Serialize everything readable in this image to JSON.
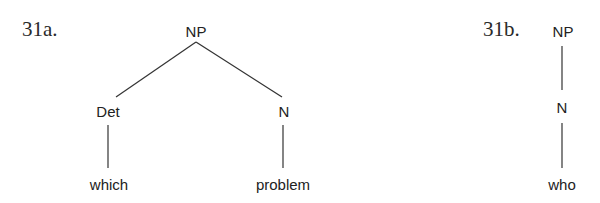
{
  "diagrams": {
    "a": {
      "label": "31a.",
      "root": "NP",
      "left_category": "Det",
      "right_category": "N",
      "left_word": "which",
      "right_word": "problem"
    },
    "b": {
      "label": "31b.",
      "root": "NP",
      "category": "N",
      "word": "who"
    }
  },
  "colors": {
    "line": "#333333",
    "text": "#222222",
    "background": "#ffffff"
  }
}
